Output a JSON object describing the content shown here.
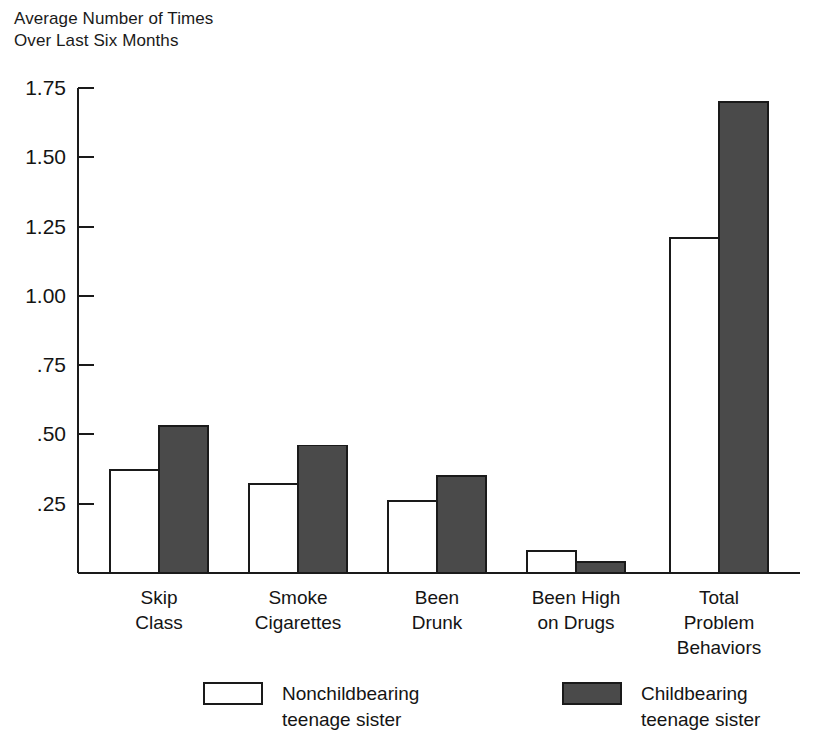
{
  "chart_data": {
    "type": "bar",
    "title": "Average Number of Times\nOver Last Six Months",
    "ylabel": "Average Number of Times Over Last Six Months",
    "xlabel": "",
    "ylim": [
      0,
      1.75
    ],
    "grid": false,
    "legend_position": "bottom",
    "ytick_labels": [
      "1.75",
      "1.50",
      "1.25",
      "1.00",
      ".75",
      ".50",
      ".25"
    ],
    "ytick_values": [
      1.75,
      1.5,
      1.25,
      1.0,
      0.75,
      0.5,
      0.25
    ],
    "categories": [
      "Skip\nClass",
      "Smoke\nCigarettes",
      "Been\nDrunk",
      "Been High\non Drugs",
      "Total\nProblem\nBehaviors"
    ],
    "series": [
      {
        "name": "Nonchildbearing\nteenage sister",
        "color": "#ffffff",
        "values": [
          0.37,
          0.32,
          0.26,
          0.08,
          1.21
        ]
      },
      {
        "name": "Childbearing\nteenage sister",
        "color": "#4a4a4a",
        "values": [
          0.53,
          0.46,
          0.35,
          0.04,
          1.7
        ]
      }
    ]
  },
  "legend": {
    "items": [
      {
        "label": "Nonchildbearing\nteenage sister",
        "swatch": "open"
      },
      {
        "label": "Childbearing\nteenage sister",
        "swatch": "filled"
      }
    ]
  },
  "colors": {
    "fill_dark": "#4a4a4a",
    "fill_light": "#ffffff",
    "stroke": "#1a1a1a",
    "background": "#ffffff"
  }
}
